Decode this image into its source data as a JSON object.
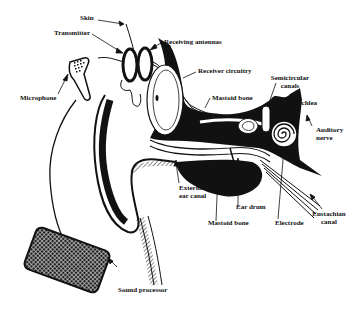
{
  "diagram": {
    "labels": {
      "skin": "Skin",
      "transmitter": "Transmitter",
      "receiving_antennas": "Receiving antennas",
      "receiver_circuitry": "Receiver circuitry",
      "mastoid_bone_top": "Mastoid bone",
      "semicircular_canals_1": "Semicircular",
      "semicircular_canals_2": "canals",
      "cochlea": "Cochlea",
      "microphone": "Microphone",
      "auditory_nerve_1": "Auditory",
      "auditory_nerve_2": "nerve",
      "external_ear_canal_1": "External",
      "external_ear_canal_2": "ear canal",
      "ear_drum": "Ear drum",
      "mastoid_bone_bottom": "Mastoid bone",
      "electrode": "Electrode",
      "eustachian_canal_1": "Eustachian",
      "eustachian_canal_2": "canal",
      "sound_processor": "Sound processor"
    },
    "colors": {
      "ink": "#111111",
      "paper": "#ffffff"
    }
  }
}
